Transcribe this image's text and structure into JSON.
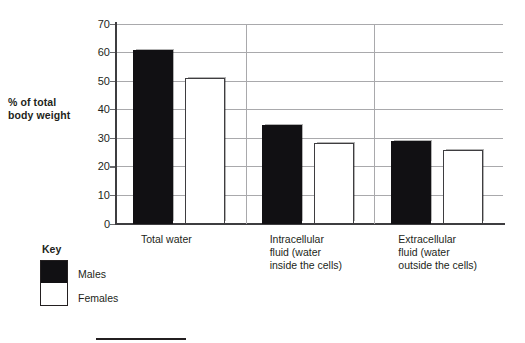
{
  "figure": {
    "y_axis_title_line1": "% of total",
    "y_axis_title_line2": "body weight"
  },
  "legend": {
    "title": "Key",
    "males_label": "Males",
    "females_label": "Females",
    "males_color": "#111013",
    "females_color": "#ffffff"
  },
  "bottom_rule": {
    "present": true
  },
  "chart_data": {
    "type": "bar",
    "title": "",
    "subtitle": "",
    "xlabel": "",
    "ylabel": "% of total body weight",
    "ylim": [
      0,
      70
    ],
    "yticks": [
      0,
      10,
      20,
      30,
      40,
      50,
      60,
      70
    ],
    "ytick_labels": [
      "0",
      "10",
      "20",
      "30",
      "40",
      "50",
      "60",
      "70"
    ],
    "grid": "horizontal",
    "legend_position": "below-left",
    "categories": [
      "Total water",
      "Intracellular fluid (water inside the cells)",
      "Extracellular fluid  (water outside the cells)"
    ],
    "category_label_lines": [
      [
        "Total water"
      ],
      [
        "Intracellular",
        "fluid (water",
        "inside the cells)"
      ],
      [
        "Extracellular",
        "fluid  (water",
        "outside the cells)"
      ]
    ],
    "series": [
      {
        "name": "Males",
        "color": "#111013",
        "values": [
          61,
          34.5,
          29
        ]
      },
      {
        "name": "Females",
        "color": "#ffffff",
        "values": [
          51,
          28.5,
          26
        ]
      }
    ]
  }
}
